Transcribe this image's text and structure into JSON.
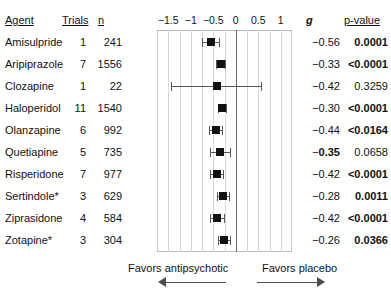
{
  "headers": {
    "agent": "Agent",
    "trials": "Trials",
    "n": "n",
    "g": "g",
    "pvalue": "p-value"
  },
  "footer": {
    "left_label": "Favors antipsychotic",
    "right_label": "Favors placebo",
    "left_arrow_icon": "arrow-left-icon",
    "right_arrow_icon": "arrow-right-icon"
  },
  "chart_data": {
    "type": "scatter",
    "subtype": "forest-plot",
    "title": "",
    "xlabel": "",
    "ylabel": "",
    "xlim": [
      -1.75,
      1.25
    ],
    "xticks": [
      -1.5,
      -1,
      -0.5,
      0,
      0.5,
      1
    ],
    "xticklabels": [
      "−1.5",
      "−1",
      "−0.5",
      "0",
      "0.5",
      "1"
    ],
    "grid": true,
    "reference_line": 0,
    "effect_measure": "g",
    "favors_left": "antipsychotic",
    "favors_right": "placebo",
    "categories": [
      "Amisulpride",
      "Aripiprazole",
      "Clozapine",
      "Haloperidol",
      "Olanzapine",
      "Quetiapine",
      "Risperidone",
      "Sertindole*",
      "Ziprasidone",
      "Zotapine*"
    ],
    "rows": [
      {
        "agent": "Amisulpride",
        "trials": "1",
        "n": "241",
        "g": "−0.56",
        "g_value": -0.56,
        "ci_low": -0.76,
        "ci_high": -0.37,
        "pvalue": "0.0001",
        "pvalue_bold": true,
        "g_bold": false
      },
      {
        "agent": "Aripiprazole",
        "trials": "7",
        "n": "1556",
        "g": "−0.33",
        "g_value": -0.33,
        "ci_low": -0.43,
        "ci_high": -0.23,
        "pvalue": "<0.0001",
        "pvalue_bold": true,
        "g_bold": false
      },
      {
        "agent": "Clozapine",
        "trials": "1",
        "n": "22",
        "g": "−0.42",
        "g_value": -0.42,
        "ci_low": -1.44,
        "ci_high": 0.57,
        "pvalue": "0.3259",
        "pvalue_bold": false,
        "g_bold": false
      },
      {
        "agent": "Haloperidol",
        "trials": "11",
        "n": "1540",
        "g": "−0.30",
        "g_value": -0.3,
        "ci_low": -0.39,
        "ci_high": -0.21,
        "pvalue": "<0.0001",
        "pvalue_bold": true,
        "g_bold": false
      },
      {
        "agent": "Olanzapine",
        "trials": "6",
        "n": "992",
        "g": "−0.44",
        "g_value": -0.44,
        "ci_low": -0.59,
        "ci_high": -0.3,
        "pvalue": "<0.0164",
        "pvalue_bold": true,
        "g_bold": false
      },
      {
        "agent": "Quetiapine",
        "trials": "5",
        "n": "735",
        "g": "−0.35",
        "g_value": -0.35,
        "ci_low": -0.57,
        "ci_high": -0.13,
        "pvalue": "0.0658",
        "pvalue_bold": false,
        "g_bold": true
      },
      {
        "agent": "Risperidone",
        "trials": "7",
        "n": "977",
        "g": "−0.42",
        "g_value": -0.42,
        "ci_low": -0.57,
        "ci_high": -0.28,
        "pvalue": "<0.0001",
        "pvalue_bold": true,
        "g_bold": false
      },
      {
        "agent": "Sertindole*",
        "trials": "3",
        "n": "629",
        "g": "−0.28",
        "g_value": -0.28,
        "ci_low": -0.41,
        "ci_high": -0.15,
        "pvalue": "0.0011",
        "pvalue_bold": true,
        "g_bold": false
      },
      {
        "agent": "Ziprasidone",
        "trials": "4",
        "n": "584",
        "g": "−0.42",
        "g_value": -0.42,
        "ci_low": -0.58,
        "ci_high": -0.27,
        "pvalue": "<0.0001",
        "pvalue_bold": true,
        "g_bold": false
      },
      {
        "agent": "Zotapine*",
        "trials": "3",
        "n": "304",
        "g": "−0.26",
        "g_value": -0.26,
        "ci_low": -0.39,
        "ci_high": -0.13,
        "pvalue": "0.0366",
        "pvalue_bold": true,
        "g_bold": false
      }
    ]
  }
}
